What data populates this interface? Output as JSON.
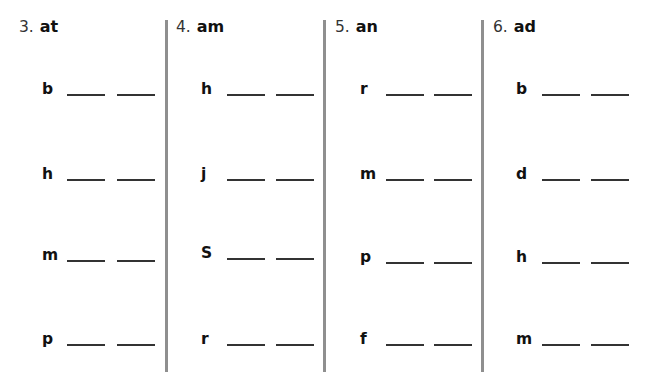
{
  "worksheet": {
    "columns": [
      {
        "number": "3.",
        "family": "at",
        "letters": [
          "b",
          "h",
          "m",
          "p"
        ]
      },
      {
        "number": "4.",
        "family": "am",
        "letters": [
          "h",
          "j",
          "S",
          "r"
        ]
      },
      {
        "number": "5.",
        "family": "an",
        "letters": [
          "r",
          "m",
          "p",
          "f"
        ]
      },
      {
        "number": "6.",
        "family": "ad",
        "letters": [
          "b",
          "d",
          "h",
          "m"
        ]
      }
    ]
  }
}
